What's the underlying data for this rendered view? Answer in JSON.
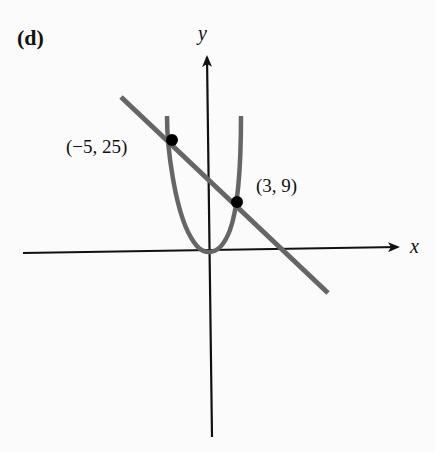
{
  "panel_label": "(d)",
  "axes": {
    "x_label": "x",
    "y_label": "y"
  },
  "points": [
    {
      "label": "(−5, 25)",
      "x": -5,
      "y": 25
    },
    {
      "label": "(3, 9)",
      "x": 3,
      "y": 9
    }
  ],
  "curves": [
    {
      "name": "parabola",
      "equation": "y = x^2",
      "color": "#666666"
    },
    {
      "name": "line",
      "equation": "y = -2x + 15",
      "color": "#666666"
    }
  ]
}
